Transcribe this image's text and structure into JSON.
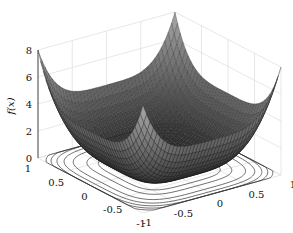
{
  "chart_data": {
    "type": "surface3d",
    "title": "",
    "xlabel": "",
    "ylabel": "",
    "zlabel": "f(x)",
    "x_ticks": [
      "-1",
      "-0.5",
      "0",
      "0.5",
      "1"
    ],
    "y_ticks": [
      "-1",
      "-0.5",
      "0",
      "0.5",
      "1"
    ],
    "z_ticks": [
      "0",
      "2",
      "4",
      "6",
      "8"
    ],
    "xlim": [
      -1,
      1
    ],
    "ylim": [
      -1,
      1
    ],
    "zlim": [
      0,
      8
    ],
    "grid": true,
    "colormap": "grayscale",
    "contours_on_floor": true,
    "surface_samples": {
      "x": [
        -1,
        -0.5,
        0,
        0.5,
        1
      ],
      "y": [
        -1,
        -0.5,
        0,
        0.5,
        1
      ],
      "z": [
        [
          8,
          4.25,
          4,
          4.25,
          8
        ],
        [
          4.25,
          0.5,
          0.25,
          0.5,
          4.25
        ],
        [
          4,
          0.25,
          0,
          0.25,
          4
        ],
        [
          4.25,
          0.5,
          0.25,
          0.5,
          4.25
        ],
        [
          8,
          4.25,
          4,
          4.25,
          8
        ]
      ]
    }
  },
  "labels": {
    "zaxis": "f(x)"
  }
}
